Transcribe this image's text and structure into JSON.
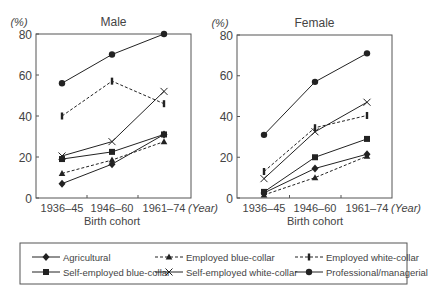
{
  "chart_data": [
    {
      "type": "line",
      "title": "Male",
      "ylabel": "(%)",
      "xlabel": "Birth cohort",
      "x_unit": "(Year)",
      "categories": [
        "1936–45",
        "1946–60",
        "1961–74"
      ],
      "ylim": [
        0,
        80
      ],
      "yticks": [
        0,
        20,
        40,
        60,
        80
      ],
      "grid": false,
      "series": [
        {
          "name": "Agricultural",
          "marker": "diamond",
          "dash": false,
          "values": [
            7,
            16.5,
            31
          ]
        },
        {
          "name": "Employed blue-collar",
          "marker": "triangle",
          "dash": true,
          "values": [
            12,
            18.5,
            27.5
          ]
        },
        {
          "name": "Employed white-collar",
          "marker": "bar",
          "dash": true,
          "values": [
            40,
            57,
            46
          ]
        },
        {
          "name": "Self-employed blue-collar",
          "marker": "square",
          "dash": false,
          "values": [
            19,
            22.5,
            31
          ]
        },
        {
          "name": "Self-employed white-collar",
          "marker": "x",
          "dash": false,
          "values": [
            20.5,
            27.5,
            52
          ]
        },
        {
          "name": "Professional/managerial",
          "marker": "circle",
          "dash": false,
          "values": [
            56,
            70,
            80
          ]
        }
      ]
    },
    {
      "type": "line",
      "title": "Female",
      "ylabel": "(%)",
      "xlabel": "Birth cohort",
      "x_unit": "(Year)",
      "categories": [
        "1936–45",
        "1946–60",
        "1961–74"
      ],
      "ylim": [
        0,
        80
      ],
      "yticks": [
        0,
        20,
        40,
        60,
        80
      ],
      "grid": false,
      "series": [
        {
          "name": "Agricultural",
          "marker": "diamond",
          "dash": false,
          "values": [
            2.5,
            14.5,
            21.5
          ]
        },
        {
          "name": "Employed blue-collar",
          "marker": "triangle",
          "dash": true,
          "values": [
            1.5,
            10,
            20.5
          ]
        },
        {
          "name": "Employed white-collar",
          "marker": "bar",
          "dash": true,
          "values": [
            13,
            34.5,
            40.5
          ]
        },
        {
          "name": "Self-employed blue-collar",
          "marker": "square",
          "dash": false,
          "values": [
            3,
            20,
            29
          ]
        },
        {
          "name": "Self-employed white-collar",
          "marker": "x",
          "dash": false,
          "values": [
            9.5,
            32.5,
            47
          ]
        },
        {
          "name": "Professional/managerial",
          "marker": "circle",
          "dash": false,
          "values": [
            31,
            57,
            71
          ]
        }
      ]
    }
  ],
  "legend": {
    "position": "bottom",
    "items": [
      {
        "label": "Agricultural",
        "marker": "diamond",
        "dash": false
      },
      {
        "label": "Employed blue-collar",
        "marker": "triangle",
        "dash": true
      },
      {
        "label": "Employed white-collar",
        "marker": "bar",
        "dash": true
      },
      {
        "label": "Self-employed blue-collar",
        "marker": "square",
        "dash": false
      },
      {
        "label": "Self-employed white-collar",
        "marker": "x",
        "dash": false
      },
      {
        "label": "Professional/managerial",
        "marker": "circle",
        "dash": false
      }
    ]
  },
  "colors": {
    "line": "#222222",
    "axis": "#555555",
    "text": "#444444"
  }
}
